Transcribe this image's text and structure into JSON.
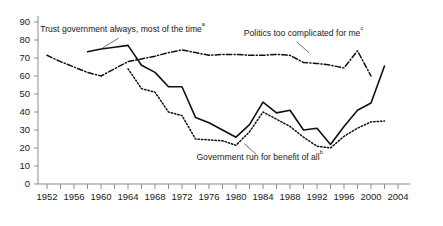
{
  "chart_data": {
    "type": "line",
    "title": "",
    "subtitle": "",
    "xlabel": "",
    "ylabel": "",
    "xlim": [
      1952,
      2004
    ],
    "ylim": [
      0,
      90
    ],
    "grid": false,
    "legend_position": "inline-annotations",
    "x_ticks": [
      1952,
      1956,
      1960,
      1964,
      1968,
      1972,
      1976,
      1980,
      1984,
      1988,
      1992,
      1996,
      2000,
      2004
    ],
    "x_minor_tick_step": 2,
    "y_ticks": [
      0,
      10,
      20,
      30,
      40,
      50,
      60,
      70,
      80,
      90
    ],
    "series": [
      {
        "name": "Trust government always, most of the time",
        "footnote": "a",
        "style": "solid",
        "x": [
          1958,
          1960,
          1962,
          1964,
          1966,
          1968,
          1970,
          1972,
          1974,
          1976,
          1978,
          1980,
          1982,
          1984,
          1986,
          1988,
          1990,
          1992,
          1994,
          1996,
          1998,
          2000,
          2002
        ],
        "values": [
          73.5,
          75,
          76,
          77,
          66,
          62,
          54,
          54,
          37,
          34,
          30,
          26,
          33,
          45.5,
          39.5,
          41,
          30,
          31,
          22,
          32,
          41,
          45,
          65.5
        ]
      },
      {
        "name": "Government run for benefit of all",
        "footnote": "b",
        "style": "dotted",
        "x": [
          1964,
          1966,
          1968,
          1970,
          1972,
          1974,
          1976,
          1978,
          1980,
          1982,
          1984,
          1986,
          1988,
          1990,
          1992,
          1994,
          1996,
          1998,
          2000,
          2002
        ],
        "values": [
          64,
          53,
          51,
          40,
          38,
          25,
          24.5,
          24,
          21.5,
          29,
          40,
          36,
          32,
          26,
          21,
          20,
          26.5,
          31,
          34.5,
          35
        ]
      },
      {
        "name": "Politics too complicated for me",
        "footnote": "c",
        "style": "dash-dot",
        "x": [
          1952,
          1954,
          1956,
          1958,
          1960,
          1962,
          1964,
          1966,
          1968,
          1970,
          1972,
          1974,
          1976,
          1978,
          1980,
          1982,
          1984,
          1986,
          1988,
          1990,
          1992,
          1994,
          1996,
          1998,
          2000
        ],
        "values": [
          71.5,
          68,
          65,
          62,
          60,
          64,
          68,
          69.5,
          71,
          73,
          74.5,
          73,
          71.5,
          72,
          72,
          71.5,
          71.5,
          72,
          71.5,
          67.5,
          67,
          66,
          64.5,
          74,
          60
        ]
      }
    ],
    "annotations": [
      {
        "id": "annotation-trust",
        "text": "Trust government always, most of the time",
        "sup": "a",
        "x": 1963.2,
        "y": 84.5
      },
      {
        "id": "annotation-politics",
        "text": "Politics too complicated for me",
        "sup": "c",
        "x": 1990.0,
        "y": 82.5
      },
      {
        "id": "annotation-benefit",
        "text": "Government run for benefit of all",
        "sup": "b",
        "x": 1983.5,
        "y": 13.5
      }
    ],
    "colors": {
      "line": "#101010",
      "axis": "#8d8d8d",
      "text": "#1a1a1a",
      "background": "#ffffff"
    }
  }
}
